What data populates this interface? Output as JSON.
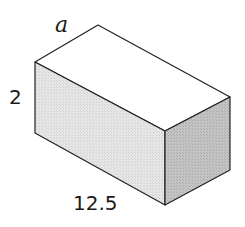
{
  "figure": {
    "type": "rectangular-prism",
    "labels": {
      "depth": "a",
      "height": "2",
      "length": "12.5"
    },
    "colors": {
      "top_face": "#ffffff",
      "front_face": "#e4e4e4",
      "side_face": "#bdbdbd",
      "edge": "#222222"
    }
  }
}
